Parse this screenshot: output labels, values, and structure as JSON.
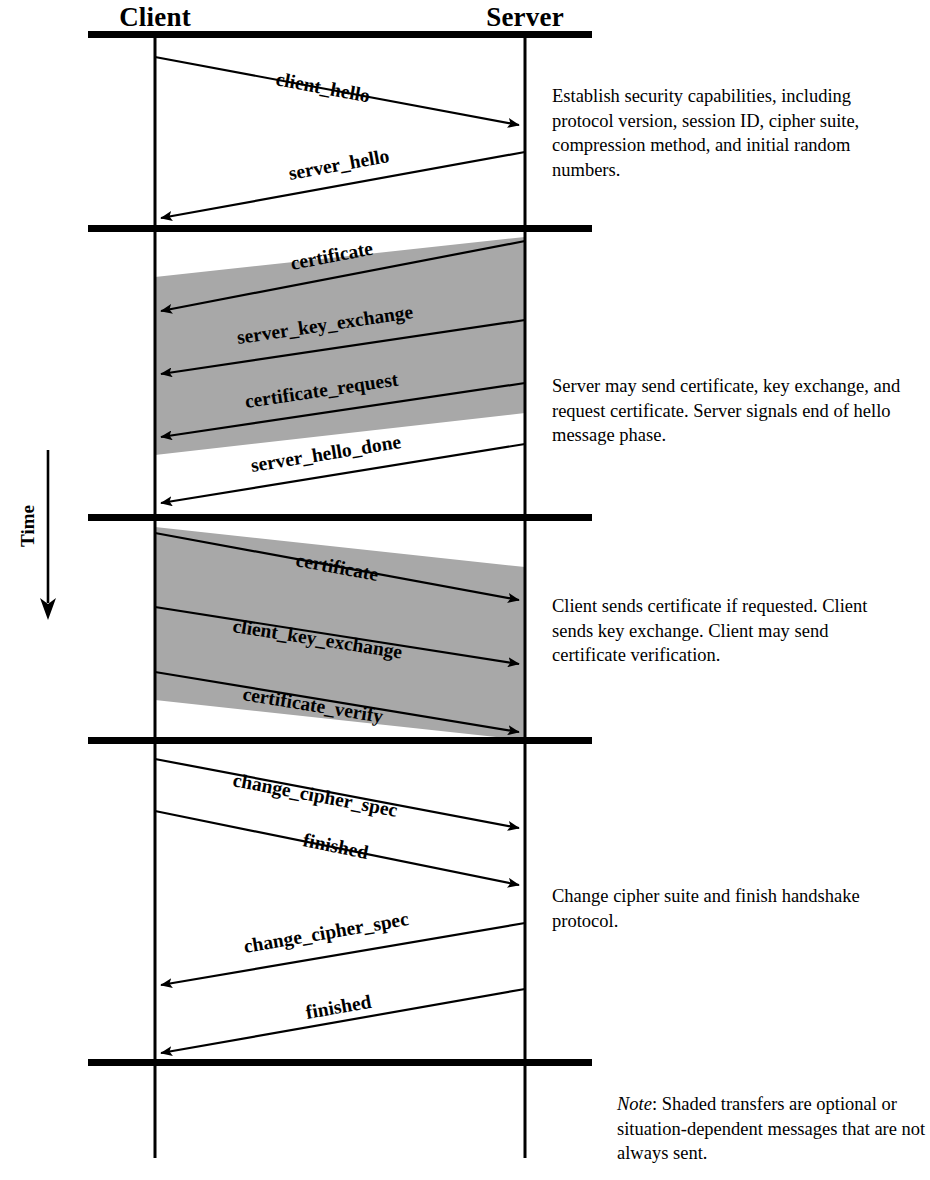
{
  "diagram": {
    "title_client": "Client",
    "title_server": "Server",
    "time_label": "Time",
    "colors": {
      "line": "#000000",
      "shade": "#a8a8a8",
      "background": "#ffffff"
    },
    "phases": [
      {
        "id": "phase-1",
        "description": "Establish security capabilities, including protocol version, session ID, cipher suite, compression method, and initial random numbers.",
        "messages": [
          {
            "label": "client_hello",
            "direction": "client-to-server",
            "shaded": false
          },
          {
            "label": "server_hello",
            "direction": "server-to-client",
            "shaded": false
          }
        ]
      },
      {
        "id": "phase-2",
        "description": "Server may send certificate, key exchange, and request certificate. Server signals end of hello message phase.",
        "messages": [
          {
            "label": "certificate",
            "direction": "server-to-client",
            "shaded": true
          },
          {
            "label": "server_key_exchange",
            "direction": "server-to-client",
            "shaded": true
          },
          {
            "label": "certificate_request",
            "direction": "server-to-client",
            "shaded": true
          },
          {
            "label": "server_hello_done",
            "direction": "server-to-client",
            "shaded": false
          }
        ]
      },
      {
        "id": "phase-3",
        "description": "Client sends certificate if requested. Client sends key exchange. Client may send certificate verification.",
        "messages": [
          {
            "label": "certificate",
            "direction": "client-to-server",
            "shaded": true
          },
          {
            "label": "client_key_exchange",
            "direction": "client-to-server",
            "shaded": true
          },
          {
            "label": "certificate_verify",
            "direction": "client-to-server",
            "shaded": true
          }
        ]
      },
      {
        "id": "phase-4",
        "description": "Change cipher suite and finish handshake protocol.",
        "messages": [
          {
            "label": "change_cipher_spec",
            "direction": "client-to-server",
            "shaded": false
          },
          {
            "label": "finished",
            "direction": "client-to-server",
            "shaded": false
          },
          {
            "label": "change_cipher_spec",
            "direction": "server-to-client",
            "shaded": false
          },
          {
            "label": "finished",
            "direction": "server-to-client",
            "shaded": false
          }
        ]
      }
    ],
    "note": {
      "lead": "Note",
      "text": ": Shaded transfers are optional or situation-dependent messages that are not always sent."
    }
  }
}
